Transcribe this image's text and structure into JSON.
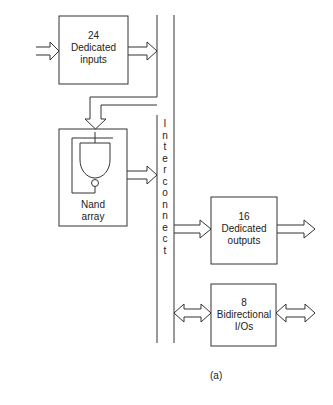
{
  "diagram": {
    "blocks": {
      "inputs": {
        "count": "24",
        "line1": "Dedicated",
        "line2": "inputs"
      },
      "nand": {
        "line1": "Nand",
        "line2": "array"
      },
      "outputs": {
        "count": "16",
        "line1": "Dedicated",
        "line2": "outputs"
      },
      "bidir": {
        "count": "8",
        "line1": "Bidirectional",
        "line2": "I/Os"
      }
    },
    "interconnect_label": [
      "I",
      "n",
      "t",
      "e",
      "r",
      "c",
      "o",
      "n",
      "n",
      "e",
      "c",
      "t"
    ],
    "caption": "(a)",
    "colors": {
      "line": "#333333",
      "background": "#ffffff"
    }
  }
}
